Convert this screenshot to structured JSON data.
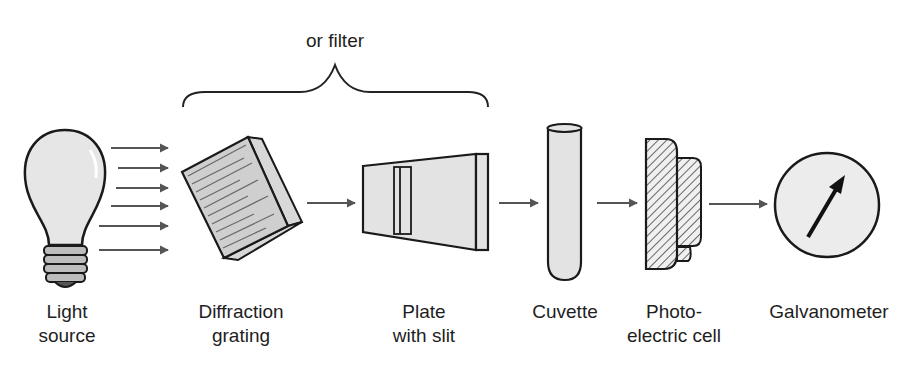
{
  "diagram": {
    "brace_label": "or filter",
    "components": [
      {
        "id": "light-source",
        "lines": [
          "Light",
          "source"
        ]
      },
      {
        "id": "diffraction-grating",
        "lines": [
          "Diffraction",
          "grating"
        ]
      },
      {
        "id": "plate-with-slit",
        "lines": [
          "Plate",
          "with slit"
        ]
      },
      {
        "id": "cuvette",
        "lines": [
          "Cuvette"
        ]
      },
      {
        "id": "photoelectric-cell",
        "lines": [
          "Photo-",
          "electric cell"
        ]
      },
      {
        "id": "galvanometer",
        "lines": [
          "Galvanometer"
        ]
      }
    ],
    "colors": {
      "outline": "#1a1a1a",
      "fill": "#e6e6e6",
      "arrow": "#555555",
      "grating_lines": "#6a6a6a"
    }
  }
}
